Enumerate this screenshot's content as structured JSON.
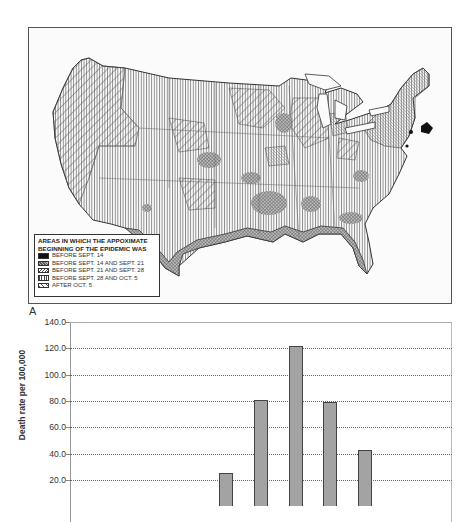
{
  "figure": {
    "panel_label": "A"
  },
  "map": {
    "legend": {
      "title_line1": "AREAS IN WHICH THE APPOXIMATE",
      "title_line2": "BEGINNING OF THE EPIDEMIC WAS",
      "items": [
        {
          "label": "BEFORE SEPT. 14",
          "pattern": "solid-black"
        },
        {
          "label": "BEFORE SEPT. 14 AND SEPT. 21",
          "pattern": "crosshatch-dense"
        },
        {
          "label": "BEFORE SEPT. 21 AND SEPT. 28",
          "pattern": "diagonal-fine"
        },
        {
          "label": "BEFORE SEPT. 28 AND OCT. 5",
          "pattern": "vertical-lines"
        },
        {
          "label": "AFTER OCT. 5",
          "pattern": "diagonal-wide"
        }
      ]
    }
  },
  "chart_data": {
    "type": "bar",
    "title": "",
    "xlabel": "",
    "ylabel": "Death rate per 100,000",
    "ylim": [
      0,
      140
    ],
    "yticks": [
      "140.0",
      "120.0",
      "100.0",
      "80.0",
      "60.0",
      "40.0",
      "20.0"
    ],
    "grid": true,
    "grid_style": "dotted",
    "categories": [
      "1",
      "2",
      "3",
      "4",
      "5",
      "6",
      "7",
      "8",
      "9",
      "10",
      "11"
    ],
    "values": [
      0,
      0,
      0,
      0,
      25,
      81,
      122,
      79,
      43,
      0,
      0
    ],
    "bar_color": "#a3a3a3",
    "note": "x-axis and lower portion of chart cropped out of view"
  }
}
